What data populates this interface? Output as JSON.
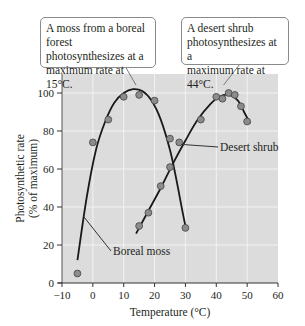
{
  "chart_data": {
    "type": "scatter",
    "title": "",
    "xlabel": "Temperature (°C)",
    "ylabel": "Photosynthetic rate (% of maximum)",
    "ylabel_lines": [
      "Photosynthetic rate",
      "(% of maximum)"
    ],
    "xlim": [
      -10,
      60
    ],
    "ylim": [
      0,
      105
    ],
    "xticks": [
      -10,
      0,
      10,
      20,
      30,
      40,
      50,
      60
    ],
    "yticks": [
      0,
      20,
      40,
      60,
      80,
      100
    ],
    "xtick_labels": [
      "−10",
      "0",
      "10",
      "20",
      "30",
      "40",
      "50",
      "60"
    ],
    "ytick_labels": [
      "0",
      "20",
      "40",
      "60",
      "80",
      "100"
    ],
    "grid": true,
    "series": [
      {
        "name": "Boreal moss",
        "points": [
          {
            "x": -5,
            "y": 5
          },
          {
            "x": 0,
            "y": 74
          },
          {
            "x": 5,
            "y": 86
          },
          {
            "x": 10,
            "y": 98
          },
          {
            "x": 15,
            "y": 99
          },
          {
            "x": 20,
            "y": 96
          },
          {
            "x": 30,
            "y": 29
          }
        ],
        "fit_curve": [
          {
            "x": -5,
            "y": 12
          },
          {
            "x": -2,
            "y": 45
          },
          {
            "x": 1,
            "y": 70
          },
          {
            "x": 4,
            "y": 85
          },
          {
            "x": 7,
            "y": 95
          },
          {
            "x": 10,
            "y": 100
          },
          {
            "x": 13,
            "y": 102
          },
          {
            "x": 16,
            "y": 101
          },
          {
            "x": 19,
            "y": 96
          },
          {
            "x": 22,
            "y": 86
          },
          {
            "x": 25,
            "y": 70
          },
          {
            "x": 27,
            "y": 55
          },
          {
            "x": 29,
            "y": 38
          },
          {
            "x": 30,
            "y": 30
          }
        ],
        "peak": {
          "x": 15,
          "y": 100
        }
      },
      {
        "name": "Desert shrub",
        "points": [
          {
            "x": 15,
            "y": 30
          },
          {
            "x": 18,
            "y": 37
          },
          {
            "x": 22,
            "y": 51
          },
          {
            "x": 25,
            "y": 61
          },
          {
            "x": 25,
            "y": 76
          },
          {
            "x": 28,
            "y": 74
          },
          {
            "x": 35,
            "y": 86
          },
          {
            "x": 40,
            "y": 98
          },
          {
            "x": 42,
            "y": 97
          },
          {
            "x": 44,
            "y": 100
          },
          {
            "x": 46,
            "y": 99
          },
          {
            "x": 48,
            "y": 93
          },
          {
            "x": 50,
            "y": 85
          }
        ],
        "fit_curve": [
          {
            "x": 14,
            "y": 26
          },
          {
            "x": 18,
            "y": 38
          },
          {
            "x": 22,
            "y": 50
          },
          {
            "x": 26,
            "y": 63
          },
          {
            "x": 30,
            "y": 75
          },
          {
            "x": 34,
            "y": 86
          },
          {
            "x": 38,
            "y": 94
          },
          {
            "x": 41,
            "y": 98
          },
          {
            "x": 44,
            "y": 99
          },
          {
            "x": 47,
            "y": 96
          },
          {
            "x": 49,
            "y": 90
          },
          {
            "x": 51,
            "y": 84
          }
        ],
        "peak": {
          "x": 44,
          "y": 100
        }
      }
    ],
    "annotations": [
      {
        "text": "A moss from a boreal forest photosynthesizes at a maximum rate at 15°C.",
        "points_to": {
          "x": 14,
          "y": 102
        }
      },
      {
        "text": "A desert shrub photosynthesizes at a maximum rate at 44°C.",
        "points_to": {
          "x": 43,
          "y": 101
        }
      },
      {
        "text": "Boreal moss",
        "points_to": {
          "x": -3,
          "y": 35
        }
      },
      {
        "text": "Desert shrub",
        "points_to": {
          "x": 28,
          "y": 73
        }
      }
    ],
    "legend_position": "none (inline labels)"
  },
  "callouts": {
    "moss": {
      "lines": [
        "A moss from a boreal forest",
        "photosynthesizes at a",
        "maximum rate at 15°C."
      ]
    },
    "shrub": {
      "lines": [
        "A desert shrub",
        "photosynthesizes at a",
        "maximum rate at 44°C."
      ]
    }
  },
  "labels": {
    "boreal_moss": "Boreal moss",
    "desert_shrub": "Desert shrub"
  },
  "colors": {
    "plot_background": "#dcdcdc",
    "gridline": "#f2f2f2",
    "curve": "#1a1a1a",
    "point_fill": "#8c8c8c",
    "point_stroke": "#4d4d4d",
    "callout_border": "#8a8a8a"
  }
}
